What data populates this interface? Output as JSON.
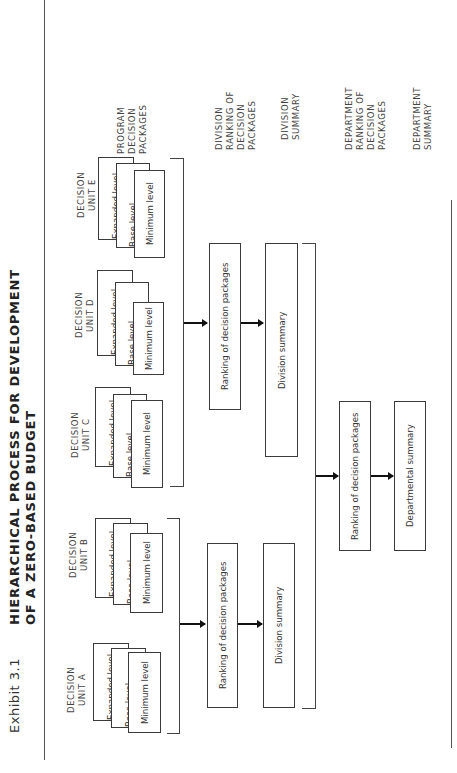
{
  "header": {
    "exhibit_label": "Exhibit 3.1",
    "title_line1": "HIERARCHICAL PROCESS FOR DEVELOPMENT",
    "title_line2": "OF A  ZERO-BASED BUDGET"
  },
  "decision_units": [
    {
      "label_line1": "DECISION",
      "label_line2": "UNIT A",
      "levels": [
        "Expanded level",
        "Base level",
        "Minimum level"
      ]
    },
    {
      "label_line1": "DECISION",
      "label_line2": "UNIT B",
      "levels": [
        "Expanded level",
        "Base level",
        "Minimum level"
      ]
    },
    {
      "label_line1": "DECISION",
      "label_line2": "UNIT C",
      "levels": [
        "Expanded level",
        "Base level",
        "Minimum level"
      ]
    },
    {
      "label_line1": "DECISION",
      "label_line2": "UNIT D",
      "levels": [
        "Expanded level",
        "Base level",
        "Minimum level"
      ]
    },
    {
      "label_line1": "DECISION",
      "label_line2": "UNIT E",
      "levels": [
        "Expanded level",
        "Base level",
        "Minimum level"
      ]
    }
  ],
  "divisions": [
    {
      "ranking_box": "Ranking of decision packages",
      "summary_box": "Division summary"
    },
    {
      "ranking_box": "Ranking of decision packages",
      "summary_box": "Division summary"
    }
  ],
  "department": {
    "ranking_box": "Ranking of decision packages",
    "summary_box": "Departmental summary"
  },
  "side_labels": {
    "program": [
      "PROGRAM",
      "DECISION",
      "PACKAGES"
    ],
    "division_ranking": [
      "DIVISION",
      "RANKING OF",
      "DECISION",
      "PACKAGES"
    ],
    "division_summary": [
      "DIVISION",
      "SUMMARY"
    ],
    "department_ranking": [
      "DEPARTMENT",
      "RANKING OF",
      "DECISION",
      "PACKAGES"
    ],
    "department_summary": [
      "DEPARTMENT",
      "SUMMARY"
    ]
  }
}
